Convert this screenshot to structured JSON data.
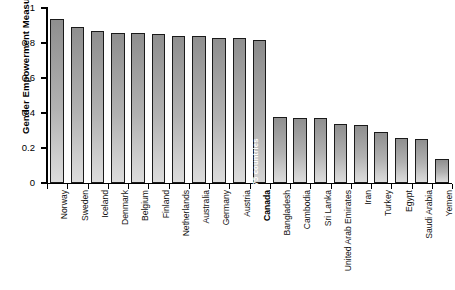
{
  "chart_data": {
    "type": "bar",
    "title": "",
    "subtitle": "",
    "xlabel": "",
    "ylabel": "Gender Empowerment Measure",
    "ylim": [
      0,
      1
    ],
    "ytick_labels": [
      "0",
      "0.2",
      "0.4",
      "0.6",
      "0.8",
      "1"
    ],
    "ytick_values": [
      0,
      0.2,
      0.4,
      0.6,
      0.8,
      1
    ],
    "grid": false,
    "legend": null,
    "highlight_category": "Canada",
    "annotations": [
      {
        "category": "Canada",
        "text": "11th of 75 countries",
        "placement": "inside-bar",
        "orientation": "vertical",
        "color": "#ffffff"
      }
    ],
    "categories": [
      "Norway",
      "Sweden",
      "Iceland",
      "Denmark",
      "Belgium",
      "Finland",
      "Netherlands",
      "Australia",
      "Germany",
      "Austria",
      "Canada",
      "Bangladesh",
      "Cambodia",
      "Sri Lanka",
      "United Arab Emirates",
      "Iran",
      "Turkey",
      "Egypt",
      "Saudi Arabia",
      "Yemen"
    ],
    "values": [
      0.94,
      0.89,
      0.87,
      0.86,
      0.86,
      0.85,
      0.84,
      0.84,
      0.83,
      0.83,
      0.82,
      0.38,
      0.37,
      0.37,
      0.34,
      0.33,
      0.29,
      0.26,
      0.25,
      0.14
    ],
    "bar_style": {
      "fill_top": "#8f8f8f",
      "fill_bottom": "#dcdcdc",
      "border": "#1a1a1a"
    }
  }
}
